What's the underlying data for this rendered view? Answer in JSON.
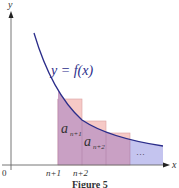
{
  "figure": {
    "caption": "Figure 5",
    "axis": {
      "x_label": "x",
      "y_label": "y",
      "origin_label": "0"
    },
    "function_label": "y = f(x)",
    "ticks": [
      "n+1",
      "n+2"
    ],
    "rect_labels": {
      "first": "a",
      "first_sub": "n+1",
      "second": "a",
      "second_sub": "n+2"
    },
    "ellipsis": "···",
    "colors": {
      "curve": "#2b2d8a",
      "rect_fill_over": "#f4c3c3",
      "rect_fill_under": "#c9a3c6",
      "tail_fill": "#c3c3ee",
      "axis": "#666666"
    }
  }
}
